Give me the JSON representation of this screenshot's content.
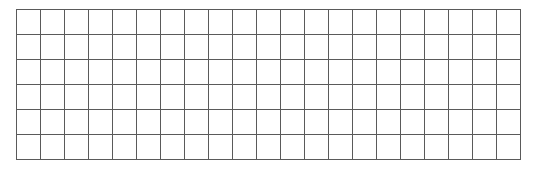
{
  "grid": {
    "columns": 21,
    "rows": 6,
    "line_color": "#5a5a5a",
    "background": "#ffffff",
    "cells": []
  }
}
